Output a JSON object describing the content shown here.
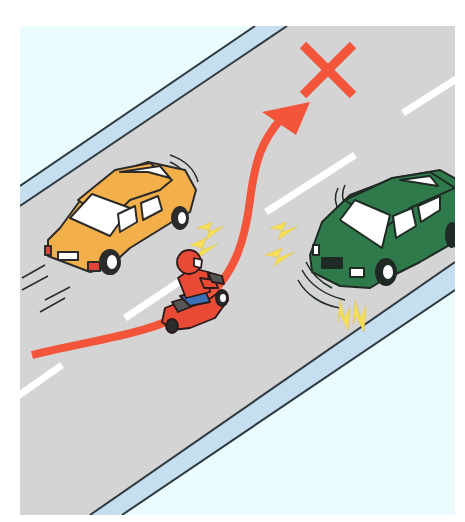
{
  "scene": {
    "title": "Motorcycle swerving between two cars — prohibited maneuver",
    "background": "#ffffff",
    "panel": {
      "x": 20,
      "y": 26,
      "width": 435,
      "height": 489
    },
    "colors": {
      "sidewalk": "#eafcfd",
      "curb_band": "#c5def0",
      "road": "#d4d4d4",
      "edge_line": "#2f3a40",
      "lane_dash": "#ffffff",
      "arrow": "#f2553a",
      "cross_mark": "#f2553a",
      "yellow_car": "#f3b04a",
      "green_car": "#2f7a4a",
      "rider": "#e84a36",
      "rider_pants": "#3b6fb8",
      "spark": "#f6e05a",
      "window": "#ffffff"
    }
  },
  "elements": {
    "cross_mark": {
      "label": "Prohibited",
      "cx": 328,
      "cy": 68
    },
    "arrow": {
      "label": "Swerve path"
    },
    "yellow_car": {
      "label": "Yellow car (left lane)"
    },
    "green_car": {
      "label": "Green car (right lane, braking)"
    },
    "motorcycle": {
      "label": "Scooter rider"
    }
  }
}
